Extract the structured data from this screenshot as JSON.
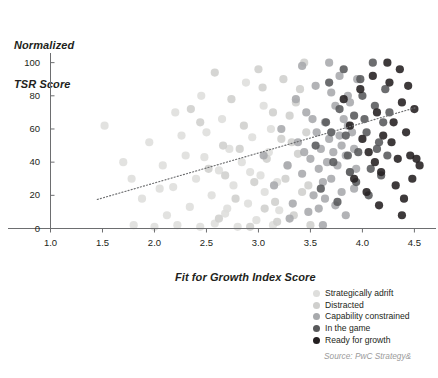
{
  "chart_data": {
    "type": "scatter",
    "title": "",
    "xlabel": "Fit for Growth Index Score",
    "ylabel": "Normalized\nTSR Score",
    "ylabel_line1": "Normalized",
    "ylabel_line2": "TSR Score",
    "xlim": [
      1.0,
      4.65
    ],
    "ylim": [
      0,
      104
    ],
    "xticks": [
      "1.0",
      "1.5",
      "2.0",
      "2.5",
      "3.0",
      "3.5",
      "4.0",
      "4.5"
    ],
    "xtick_values": [
      1.0,
      1.5,
      2.0,
      2.5,
      3.0,
      3.5,
      4.0,
      4.5
    ],
    "yticks": [
      "0",
      "20",
      "40",
      "60",
      "80",
      "100"
    ],
    "ytick_values": [
      0,
      20,
      40,
      60,
      80,
      100
    ],
    "grid": false,
    "legend_position": "bottom-right",
    "source": "Source: PwC Strategy&",
    "trendline": {
      "style": "dotted",
      "color": "#6d6e70",
      "x_start": 1.45,
      "y_start": 17.5,
      "x_end": 4.52,
      "y_end": 73.0
    },
    "series": [
      {
        "name": "Strategically adrift",
        "color": "#dededc",
        "points": [
          [
            1.52,
            62
          ],
          [
            1.78,
            30
          ],
          [
            1.8,
            2
          ],
          [
            1.95,
            52
          ],
          [
            2.0,
            1
          ],
          [
            2.08,
            38
          ],
          [
            2.12,
            8
          ],
          [
            2.18,
            25
          ],
          [
            2.22,
            2
          ],
          [
            2.3,
            44
          ],
          [
            2.34,
            13
          ],
          [
            2.4,
            30
          ],
          [
            2.44,
            1
          ],
          [
            2.5,
            58
          ],
          [
            2.55,
            20
          ],
          [
            2.58,
            3
          ],
          [
            2.62,
            35
          ],
          [
            2.68,
            9
          ],
          [
            2.72,
            48
          ],
          [
            2.76,
            26
          ],
          [
            2.8,
            1
          ],
          [
            2.84,
            40
          ],
          [
            2.9,
            15
          ],
          [
            2.94,
            55
          ],
          [
            2.98,
            5
          ],
          [
            3.02,
            32
          ],
          [
            3.06,
            22
          ],
          [
            3.1,
            46
          ],
          [
            3.14,
            2
          ],
          [
            3.18,
            28
          ],
          [
            2.2,
            70
          ],
          [
            2.45,
            80
          ],
          [
            2.65,
            66
          ],
          [
            2.88,
            88
          ],
          [
            3.05,
            74
          ],
          [
            1.88,
            18
          ],
          [
            2.05,
            24
          ],
          [
            2.26,
            56
          ],
          [
            2.48,
            43
          ],
          [
            2.7,
            12
          ],
          [
            2.92,
            34
          ],
          [
            3.12,
            60
          ],
          [
            1.7,
            40
          ],
          [
            3.2,
            11
          ]
        ]
      },
      {
        "name": "Distracted",
        "color": "#cfcfcd",
        "points": [
          [
            2.35,
            72
          ],
          [
            2.52,
            36
          ],
          [
            2.66,
            50
          ],
          [
            2.78,
            18
          ],
          [
            2.86,
            62
          ],
          [
            2.96,
            28
          ],
          [
            3.04,
            85
          ],
          [
            3.08,
            42
          ],
          [
            3.16,
            16
          ],
          [
            3.22,
            54
          ],
          [
            3.26,
            30
          ],
          [
            3.3,
            68
          ],
          [
            3.34,
            8
          ],
          [
            3.38,
            45
          ],
          [
            3.42,
            22
          ],
          [
            3.46,
            58
          ],
          [
            3.5,
            2
          ],
          [
            2.58,
            94
          ],
          [
            2.74,
            78
          ],
          [
            3.0,
            96
          ],
          [
            3.24,
            90
          ],
          [
            3.36,
            76
          ],
          [
            3.44,
            100
          ],
          [
            2.44,
            64
          ],
          [
            2.62,
            6
          ],
          [
            2.82,
            48
          ],
          [
            3.06,
            12
          ],
          [
            3.28,
            38
          ],
          [
            3.4,
            84
          ],
          [
            3.48,
            26
          ],
          [
            2.92,
            1
          ],
          [
            3.14,
            70
          ],
          [
            3.32,
            52
          ],
          [
            2.68,
            32
          ],
          [
            3.18,
            4
          ]
        ]
      },
      {
        "name": "Capability constrained",
        "color": "#a7a9ac",
        "points": [
          [
            3.05,
            44
          ],
          [
            3.15,
            26
          ],
          [
            3.22,
            60
          ],
          [
            3.28,
            38
          ],
          [
            3.33,
            15
          ],
          [
            3.38,
            52
          ],
          [
            3.42,
            33
          ],
          [
            3.46,
            70
          ],
          [
            3.5,
            42
          ],
          [
            3.53,
            20
          ],
          [
            3.56,
            58
          ],
          [
            3.58,
            36
          ],
          [
            3.6,
            48
          ],
          [
            3.62,
            28
          ],
          [
            3.64,
            64
          ],
          [
            3.66,
            40
          ],
          [
            3.68,
            54
          ],
          [
            3.7,
            30
          ],
          [
            3.72,
            46
          ],
          [
            3.74,
            74
          ],
          [
            3.76,
            38
          ],
          [
            3.78,
            56
          ],
          [
            3.8,
            22
          ],
          [
            3.82,
            66
          ],
          [
            3.84,
            44
          ],
          [
            3.86,
            80
          ],
          [
            3.88,
            34
          ],
          [
            3.9,
            58
          ],
          [
            3.92,
            48
          ],
          [
            3.95,
            90
          ],
          [
            3.42,
            98
          ],
          [
            3.55,
            86
          ],
          [
            3.68,
            100
          ],
          [
            3.78,
            92
          ],
          [
            3.88,
            76
          ],
          [
            3.3,
            6
          ],
          [
            3.48,
            10
          ],
          [
            3.62,
            2
          ],
          [
            3.74,
            14
          ],
          [
            3.84,
            8
          ],
          [
            3.36,
            78
          ],
          [
            3.52,
            66
          ],
          [
            3.64,
            18
          ],
          [
            3.86,
            62
          ],
          [
            3.94,
            36
          ],
          [
            3.44,
            46
          ],
          [
            3.58,
            12
          ],
          [
            3.7,
            82
          ],
          [
            3.8,
            50
          ],
          [
            3.92,
            24
          ]
        ]
      },
      {
        "name": "In the game",
        "color": "#58595b",
        "points": [
          [
            3.55,
            50
          ],
          [
            3.65,
            64
          ],
          [
            3.72,
            40
          ],
          [
            3.78,
            72
          ],
          [
            3.84,
            56
          ],
          [
            3.88,
            34
          ],
          [
            3.92,
            68
          ],
          [
            3.96,
            46
          ],
          [
            4.0,
            80
          ],
          [
            4.04,
            58
          ],
          [
            4.08,
            36
          ],
          [
            4.12,
            74
          ],
          [
            4.16,
            52
          ],
          [
            4.2,
            64
          ],
          [
            4.24,
            44
          ],
          [
            3.68,
            88
          ],
          [
            3.82,
            96
          ],
          [
            3.98,
            90
          ],
          [
            4.1,
            100
          ],
          [
            4.22,
            84
          ],
          [
            3.6,
            24
          ],
          [
            3.76,
            16
          ],
          [
            3.94,
            28
          ],
          [
            4.06,
            20
          ],
          [
            4.18,
            32
          ],
          [
            4.02,
            66
          ],
          [
            4.14,
            48
          ],
          [
            3.86,
            44
          ],
          [
            4.26,
            70
          ],
          [
            3.7,
            58
          ]
        ]
      },
      {
        "name": "Ready for growth",
        "color": "#231f20",
        "points": [
          [
            3.88,
            62
          ],
          [
            3.98,
            84
          ],
          [
            4.06,
            46
          ],
          [
            4.14,
            70
          ],
          [
            4.2,
            56
          ],
          [
            4.26,
            88
          ],
          [
            4.3,
            64
          ],
          [
            4.34,
            42
          ],
          [
            4.38,
            76
          ],
          [
            4.42,
            58
          ],
          [
            4.46,
            44
          ],
          [
            4.5,
            72
          ],
          [
            4.52,
            42
          ],
          [
            4.55,
            38
          ],
          [
            4.1,
            92
          ],
          [
            4.24,
            100
          ],
          [
            4.36,
            96
          ],
          [
            4.44,
            86
          ],
          [
            3.92,
            30
          ],
          [
            4.04,
            22
          ],
          [
            4.18,
            34
          ],
          [
            4.32,
            26
          ],
          [
            4.4,
            18
          ],
          [
            4.48,
            30
          ],
          [
            3.82,
            78
          ],
          [
            4.0,
            54
          ],
          [
            4.12,
            40
          ],
          [
            4.28,
            52
          ],
          [
            4.16,
            14
          ],
          [
            4.38,
            8
          ]
        ]
      }
    ]
  },
  "legend": {
    "items": [
      {
        "label": "Strategically adrift",
        "color": "#dededc"
      },
      {
        "label": "Distracted",
        "color": "#cfcfcd"
      },
      {
        "label": "Capability constrained",
        "color": "#a7a9ac"
      },
      {
        "label": "In the game",
        "color": "#58595b"
      },
      {
        "label": "Ready for growth",
        "color": "#231f20"
      }
    ]
  }
}
